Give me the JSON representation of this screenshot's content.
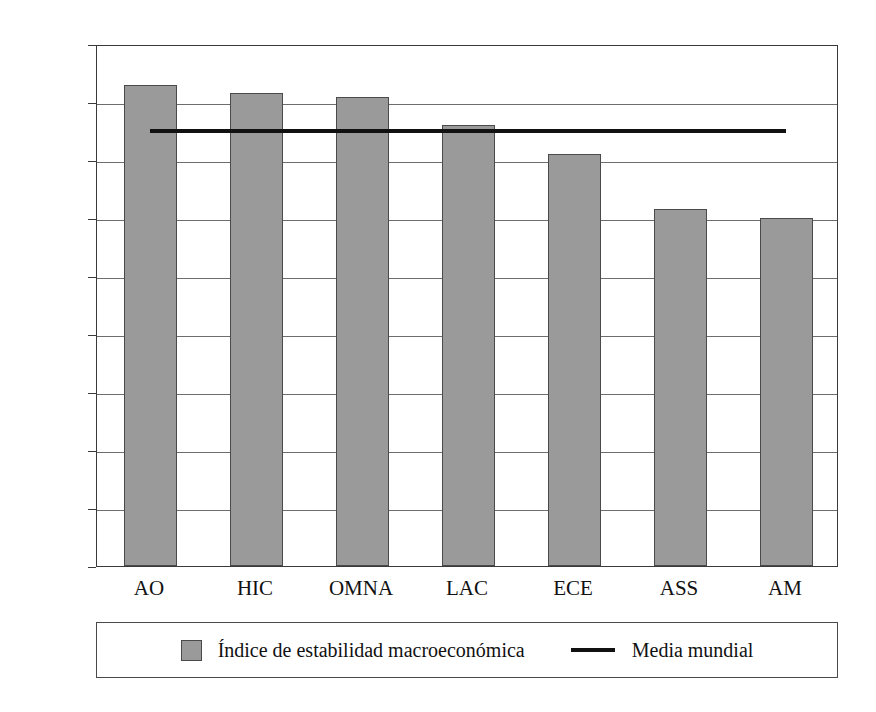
{
  "chart_data": {
    "type": "bar",
    "title": "",
    "subtitle": "",
    "xlabel": "",
    "ylabel": "",
    "categories": [
      "AO",
      "HIC",
      "OMNA",
      "LAC",
      "ECE",
      "ASS",
      "AM"
    ],
    "series": [
      {
        "name": "Índice de estabilidad macroeconómica",
        "type": "bar",
        "color": "#9a9a9a",
        "values": [
          0.83,
          0.815,
          0.808,
          0.76,
          0.71,
          0.615,
          0.6
        ]
      },
      {
        "name": "Media mundial",
        "type": "line",
        "color": "#111111",
        "value": 0.757
      }
    ],
    "ylim": [
      0.0,
      0.9
    ],
    "ytick_values": [
      0.9,
      0.8,
      0.7,
      0.6,
      0.5,
      0.4,
      0.3,
      0.2,
      0.1,
      0.0
    ],
    "ytick_labels": [
      "0,90",
      "0,80",
      "0,70",
      "0,60",
      "0,50",
      "0,40",
      "0,30",
      "0,20",
      "0,10",
      "0,00"
    ],
    "grid": true,
    "grid_axis": "y",
    "legend_position": "bottom"
  },
  "legend": {
    "entries": [
      {
        "marker": "square-swatch",
        "label": "Índice de estabilidad macroeconómica"
      },
      {
        "marker": "line-swatch",
        "label": "Media mundial"
      }
    ]
  }
}
